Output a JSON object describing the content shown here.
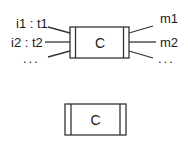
{
  "diagram": {
    "top_component": {
      "label": "C",
      "inputs": [
        "i1 : t1",
        "i2 : t2",
        "..."
      ],
      "outputs": [
        "m1",
        "m2",
        "..."
      ]
    },
    "bottom_component": {
      "label": "C"
    },
    "colors": {
      "stroke": "#333333",
      "background": "#ffffff"
    }
  }
}
